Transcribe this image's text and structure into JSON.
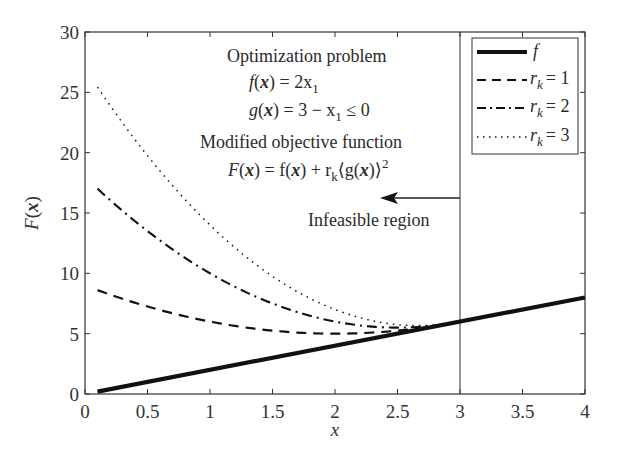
{
  "chart_data": {
    "type": "line",
    "title": "",
    "xlabel": "x",
    "ylabel": "F(x)",
    "xlim": [
      0,
      4
    ],
    "ylim": [
      0,
      30
    ],
    "grid": false,
    "legend_position": "upper right",
    "x_ticks": [
      "0",
      "0.5",
      "1",
      "1.5",
      "2",
      "2.5",
      "3",
      "3.5",
      "4"
    ],
    "y_ticks": [
      "0",
      "5",
      "10",
      "15",
      "20",
      "25",
      "30"
    ],
    "x": [
      0.1,
      0.5,
      1.0,
      1.5,
      2.0,
      2.5,
      3.0,
      3.5,
      4.0
    ],
    "series": [
      {
        "name": "f",
        "style": "solid-thick",
        "x": [
          0.1,
          4.0
        ],
        "values": [
          0.2,
          8.0
        ]
      },
      {
        "name": "r_k = 1",
        "style": "dashed",
        "x": [
          0.1,
          0.5,
          1.0,
          1.5,
          2.0,
          2.5,
          3.0
        ],
        "values": [
          8.61,
          7.25,
          6.0,
          5.25,
          5.0,
          5.25,
          6.0
        ]
      },
      {
        "name": "r_k = 2",
        "style": "dashdot",
        "x": [
          0.1,
          0.5,
          1.0,
          1.5,
          2.0,
          2.5,
          3.0
        ],
        "values": [
          17.02,
          13.5,
          10.0,
          7.5,
          6.0,
          5.5,
          6.0
        ]
      },
      {
        "name": "r_k = 3",
        "style": "dotted",
        "x": [
          0.1,
          0.5,
          1.0,
          1.5,
          2.0,
          2.5,
          3.0
        ],
        "values": [
          25.43,
          19.75,
          14.0,
          9.75,
          7.0,
          5.75,
          6.0
        ]
      }
    ],
    "annotations": [
      "Optimization problem",
      "f(x) = 2x1",
      "g(x) = 3 − x1 ≤ 0",
      "Modified objective function",
      "F(x) = f(x) + r_k⟨g(x)⟩²",
      "Infeasible region"
    ],
    "vertical_line_x": 3
  },
  "labels": {
    "xlabel": "x",
    "ylabel_F": "F",
    "ylabel_x": "x",
    "annot_title": "Optimization problem",
    "annot_f_lhs": "f",
    "annot_f_rhs": "= 2x",
    "annot_f_sub": "1",
    "annot_g_lhs": "g",
    "annot_g_rhs_a": "= 3 − x",
    "annot_g_sub": "1",
    "annot_g_rhs_b": " ≤ 0",
    "annot_mod_title": "Modified objective function",
    "annot_F_lhs": "F",
    "annot_F_mid": "= f",
    "annot_F_plus": "+ r",
    "annot_F_k": "k",
    "annot_F_g": "⟨g",
    "annot_F_close": ")⟩",
    "annot_F_sq": "2",
    "infeasible": "Infeasible region",
    "legend_f": "f",
    "legend_r": "r",
    "legend_k": "k",
    "legend_r1": "= 1",
    "legend_r2": "= 2",
    "legend_r3": "= 3"
  },
  "colors": {
    "line": "#1a1a1a",
    "axis": "#333333",
    "background": "#ffffff"
  }
}
